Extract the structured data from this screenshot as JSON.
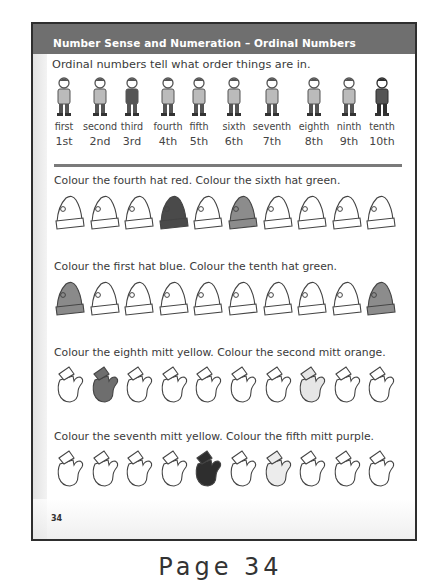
{
  "header": {
    "title": "Number Sense and Numeration – Ordinal Numbers"
  },
  "intro": "Ordinal numbers tell what order things are in.",
  "ordinals": [
    {
      "word": "first",
      "num": "1st",
      "figure": "astronaut-icon"
    },
    {
      "word": "second",
      "num": "2nd",
      "figure": "doctor-icon"
    },
    {
      "word": "third",
      "num": "3rd",
      "figure": "teacher-icon"
    },
    {
      "word": "fourth",
      "num": "4th",
      "figure": "mechanic-icon"
    },
    {
      "word": "fifth",
      "num": "5th",
      "figure": "plumber-icon"
    },
    {
      "word": "sixth",
      "num": "6th",
      "figure": "cleaner-icon"
    },
    {
      "word": "seventh",
      "num": "7th",
      "figure": "construction-worker-icon"
    },
    {
      "word": "eighth",
      "num": "8th",
      "figure": "chef-icon"
    },
    {
      "word": "ninth",
      "num": "9th",
      "figure": "nurse-icon"
    },
    {
      "word": "tenth",
      "num": "10th",
      "figure": "firefighter-icon"
    }
  ],
  "exercises": [
    {
      "instruction": "Colour the fourth hat red. Colour the sixth hat green.",
      "item": "hat",
      "fills": [
        "#ffffff",
        "#ffffff",
        "#ffffff",
        "#4a4a4a",
        "#ffffff",
        "#8c8c8c",
        "#ffffff",
        "#ffffff",
        "#ffffff",
        "#ffffff"
      ]
    },
    {
      "instruction": "Colour the first hat blue. Colour the tenth hat green.",
      "item": "hat",
      "fills": [
        "#8a8a8a",
        "#ffffff",
        "#ffffff",
        "#ffffff",
        "#ffffff",
        "#ffffff",
        "#ffffff",
        "#ffffff",
        "#ffffff",
        "#8c8c8c"
      ]
    },
    {
      "instruction": "Colour the eighth mitt yellow. Colour the second mitt orange.",
      "item": "mitt",
      "fills": [
        "#ffffff",
        "#6e6e6e",
        "#ffffff",
        "#ffffff",
        "#ffffff",
        "#ffffff",
        "#ffffff",
        "#e6e6e6",
        "#ffffff",
        "#ffffff"
      ]
    },
    {
      "instruction": "Colour the seventh mitt yellow. Colour the fifth mitt purple.",
      "item": "mitt",
      "fills": [
        "#ffffff",
        "#ffffff",
        "#ffffff",
        "#ffffff",
        "#2e2e2e",
        "#ffffff",
        "#ececec",
        "#ffffff",
        "#ffffff",
        "#ffffff"
      ]
    }
  ],
  "page_number": "34",
  "caption": "Page 34"
}
